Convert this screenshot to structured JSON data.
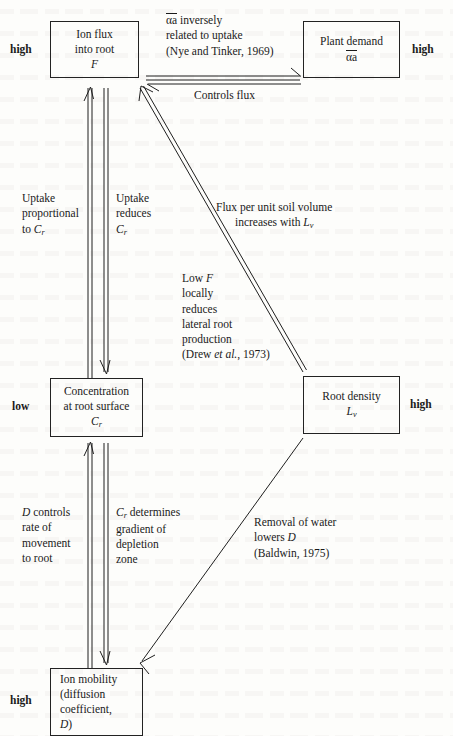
{
  "diagram": {
    "nodes": {
      "ion_flux": {
        "line1": "Ion flux",
        "line2": "into root",
        "line3": "F",
        "level_label": "high"
      },
      "plant_demand": {
        "line1": "Plant demand",
        "line2": "αa",
        "level_label": "high"
      },
      "concentration": {
        "line1": "Concentration",
        "line2": "at root surface",
        "line3": "Cr",
        "level_label": "low"
      },
      "root_density": {
        "line1": "Root density",
        "line2": "Lv",
        "level_label": "high"
      },
      "ion_mobility": {
        "line1": "Ion mobility",
        "line2": "(diffusion",
        "line3": "coefficient,",
        "line4": "D)",
        "level_label": "high"
      }
    },
    "annotations": {
      "alpha_inversely": {
        "line1": "αa inversely",
        "line2": "related to uptake",
        "line3": "(Nye and Tinker, 1969)"
      },
      "controls_flux": {
        "text": "Controls flux"
      },
      "uptake_proportional": {
        "line1": "Uptake",
        "line2": "proportional",
        "line3": "to Cr"
      },
      "uptake_reduces": {
        "line1": "Uptake",
        "line2": "reduces",
        "line3": "Cr"
      },
      "flux_per_unit": {
        "line1": "Flux per unit soil volume",
        "line2": "increases with Lv"
      },
      "low_f": {
        "line1": "Low F",
        "line2": "locally",
        "line3": "reduces",
        "line4": "lateral root",
        "line5": "production",
        "line6": "(Drew et al., 1973)"
      },
      "d_controls": {
        "line1": "D controls",
        "line2": "rate of",
        "line3": "movement",
        "line4": "to root"
      },
      "cr_determines": {
        "line1": "Cr determines",
        "line2": "gradient of",
        "line3": "depletion",
        "line4": "zone"
      },
      "removal_of_water": {
        "line1": "Removal of water",
        "line2": "lowers D",
        "line3": "(Baldwin, 1975)"
      }
    },
    "colors": {
      "ink": "#1f1f1f",
      "page": "#fdfdfb"
    }
  }
}
